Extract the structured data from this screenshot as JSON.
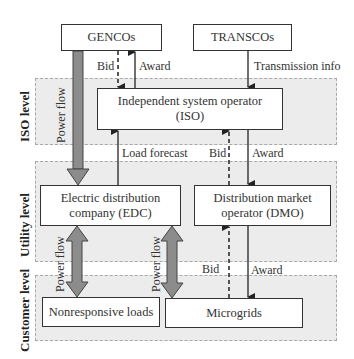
{
  "diagram": {
    "levels": [
      {
        "id": "iso",
        "label": "ISO level"
      },
      {
        "id": "utility",
        "label": "Utility level"
      },
      {
        "id": "customer",
        "label": "Customer level"
      }
    ],
    "nodes": {
      "gencos": {
        "label": "GENCOs"
      },
      "transcos": {
        "label": "TRANSCOs"
      },
      "iso": {
        "line1": "Independent system operator",
        "line2": "(ISO)"
      },
      "edc": {
        "line1": "Electric distribution",
        "line2": "company (EDC)"
      },
      "dmo": {
        "line1": "Distribution market",
        "line2": "operator (DMO)"
      },
      "nonresponsive": {
        "label": "Nonresponsive loads"
      },
      "microgrids": {
        "label": "Microgrids"
      }
    },
    "edges": {
      "gencos_bid": "Bid",
      "gencos_award": "Award",
      "transmission_info": "Transmission info",
      "power_flow_gen": "Power flow",
      "load_forecast": "Load forecast",
      "dmo_bid": "Bid",
      "dmo_award": "Award",
      "power_flow_nonresp": "Power flow",
      "power_flow_micro": "Power flow",
      "micro_bid": "Bid",
      "micro_award": "Award"
    },
    "colors": {
      "band_fill": "#ececec",
      "band_border": "#a8a8a8",
      "power_arrow_fill": "#8c8c8c",
      "line": "#222222"
    }
  }
}
